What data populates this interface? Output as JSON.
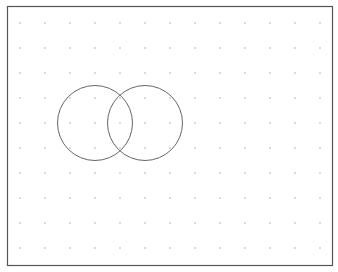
{
  "canvas": {
    "width": 338,
    "height": 272,
    "background": "#ffffff",
    "frame": {
      "x": 7.5,
      "y": 6.5,
      "width": 325,
      "height": 259,
      "stroke": "#555555",
      "stroke_width": 1.2
    }
  },
  "grid": {
    "x_start": 20,
    "y_start": 23,
    "spacing": 25,
    "cols": 13,
    "rows": 10,
    "dot_color": "#9a9a9a",
    "dot_radius": 0.7
  },
  "shapes": [
    {
      "type": "circle",
      "name": "left-circle",
      "cx": 95,
      "cy": 123,
      "r": 37.5,
      "stroke": "#666666"
    },
    {
      "type": "circle",
      "name": "right-circle",
      "cx": 145,
      "cy": 123,
      "r": 37.5,
      "stroke": "#666666"
    }
  ]
}
